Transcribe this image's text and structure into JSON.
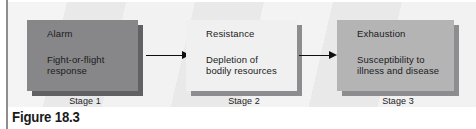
{
  "figure": {
    "caption": "Figure 18.3",
    "panel_bg": "#ececed",
    "rule_color": "#8e8e90"
  },
  "stages": [
    {
      "id": "alarm",
      "title": "Alarm",
      "desc_lines": [
        "Fight-or-flight",
        "response"
      ],
      "label": "Stage 1",
      "fill": "#878789",
      "shadow": "#616163"
    },
    {
      "id": "resistance",
      "title": "Resistance",
      "desc_lines": [
        "Depletion of",
        "bodily resources"
      ],
      "label": "Stage 2",
      "fill": "#f0f0f0",
      "shadow": "#8d8d8f"
    },
    {
      "id": "exhaustion",
      "title": "Exhaustion",
      "desc_lines": [
        "Susceptibility to",
        "illness and disease"
      ],
      "label": "Stage 3",
      "fill": "#b4b4b5",
      "shadow": "#8d8d8f"
    }
  ],
  "arrows": [
    {
      "id": "alarm-to-resistance",
      "from": "Stage 1",
      "to": "Stage 2",
      "color": "#0f0f0f"
    },
    {
      "id": "resistance-to-exhaustion",
      "from": "Stage 2",
      "to": "Stage 3",
      "color": "#0f0f0f"
    }
  ]
}
